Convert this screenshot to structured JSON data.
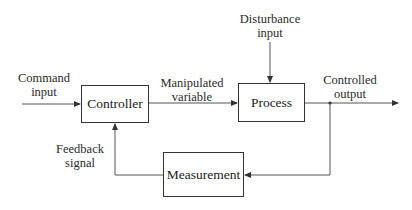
{
  "diagram": {
    "type": "feedback control loop block diagram",
    "blocks": {
      "controller": "Controller",
      "process": "Process",
      "measurement": "Measurement"
    },
    "signals": {
      "command_input": [
        "Command",
        "input"
      ],
      "manipulated_variable": [
        "Manipulated",
        "variable"
      ],
      "disturbance_input": [
        "Disturbance",
        "input"
      ],
      "controlled_output": [
        "Controlled",
        "output"
      ],
      "feedback_signal": [
        "Feedback",
        "signal"
      ]
    },
    "connections": [
      {
        "from": "Command input",
        "to": "Controller"
      },
      {
        "from": "Controller",
        "to": "Process",
        "label": "Manipulated variable"
      },
      {
        "from": "Disturbance input",
        "to": "Process"
      },
      {
        "from": "Process",
        "to": "Controlled output"
      },
      {
        "from": "Controlled output",
        "to": "Measurement"
      },
      {
        "from": "Measurement",
        "to": "Controller",
        "label": "Feedback signal"
      }
    ],
    "colors": {
      "line": "#444444",
      "box_border": "#333333",
      "background": "#ffffff"
    }
  }
}
